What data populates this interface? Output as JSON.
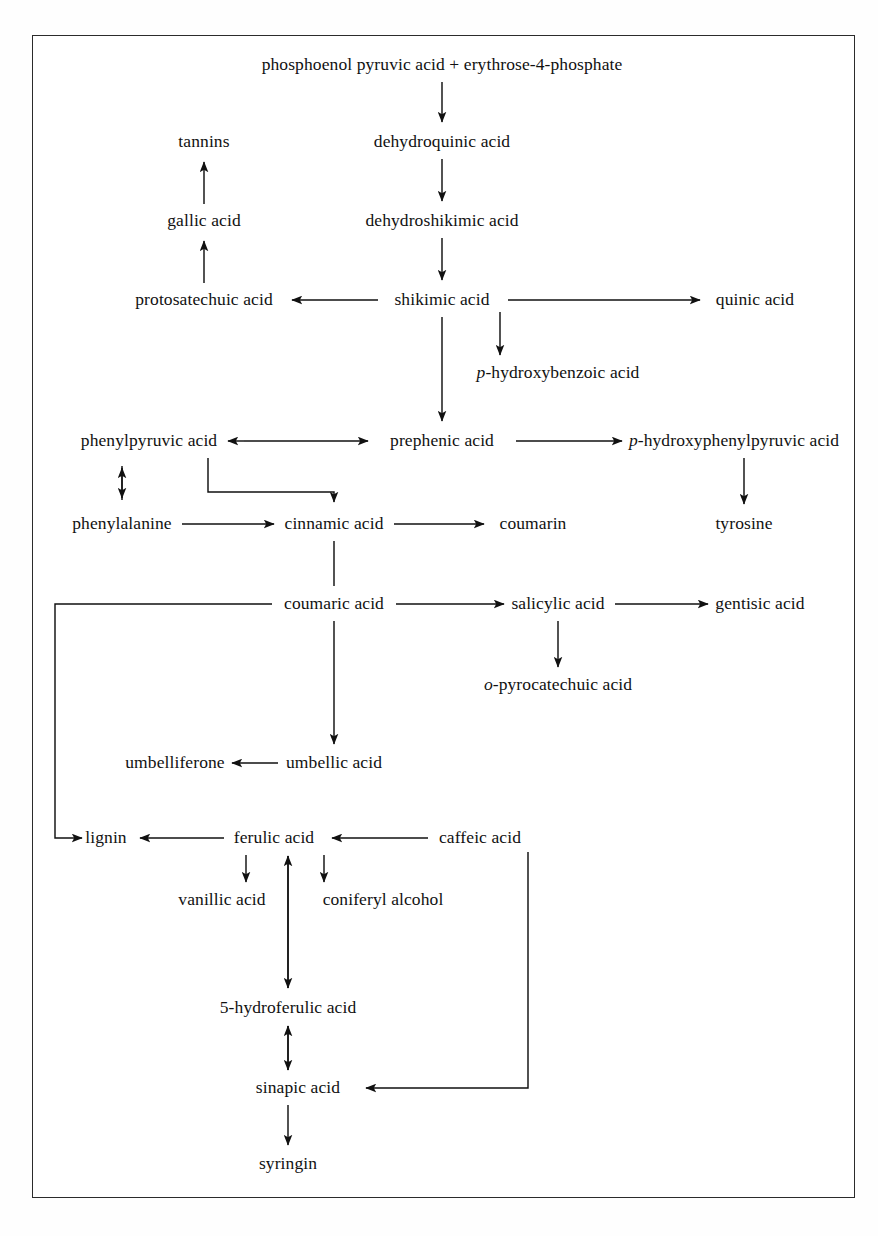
{
  "figure": {
    "frame_color": "#2b2b2b",
    "background_color": "#ffffff",
    "text_color": "#111111",
    "caption": ""
  },
  "nodes": [
    {
      "id": "pep",
      "label_prefix": "",
      "label": "phosphoenol pyruvic acid + erythrose-4-phosphate",
      "x": 442,
      "y": 65
    },
    {
      "id": "dehydroquinic",
      "label_prefix": "",
      "label": "dehydroquinic acid",
      "x": 442,
      "y": 142
    },
    {
      "id": "dehydroshikimic",
      "label_prefix": "",
      "label": "dehydroshikimic acid",
      "x": 442,
      "y": 221
    },
    {
      "id": "shikimic",
      "label_prefix": "",
      "label": "shikimic acid",
      "x": 442,
      "y": 300
    },
    {
      "id": "tannins",
      "label_prefix": "",
      "label": "tannins",
      "x": 204,
      "y": 142
    },
    {
      "id": "gallic",
      "label_prefix": "",
      "label": "gallic acid",
      "x": 204,
      "y": 221
    },
    {
      "id": "protosatechuic",
      "label_prefix": "",
      "label": "protosatechuic acid",
      "x": 204,
      "y": 300
    },
    {
      "id": "quinic",
      "label_prefix": "",
      "label": "quinic acid",
      "x": 755,
      "y": 300
    },
    {
      "id": "phba",
      "label_prefix": "p",
      "label": "-hydroxybenzoic acid",
      "x": 558,
      "y": 373
    },
    {
      "id": "phenylpyruvic",
      "label_prefix": "",
      "label": "phenylpyruvic acid",
      "x": 149,
      "y": 441
    },
    {
      "id": "prephenic",
      "label_prefix": "",
      "label": "prephenic acid",
      "x": 442,
      "y": 441
    },
    {
      "id": "hppa",
      "label_prefix": "p",
      "label": "-hydroxyphenylpyruvic acid",
      "x": 734,
      "y": 441
    },
    {
      "id": "phenylalanine",
      "label_prefix": "",
      "label": "phenylalanine",
      "x": 122,
      "y": 524
    },
    {
      "id": "cinnamic",
      "label_prefix": "",
      "label": "cinnamic acid",
      "x": 334,
      "y": 524
    },
    {
      "id": "coumarin",
      "label_prefix": "",
      "label": "coumarin",
      "x": 533,
      "y": 524
    },
    {
      "id": "tyrosine",
      "label_prefix": "",
      "label": "tyrosine",
      "x": 744,
      "y": 524
    },
    {
      "id": "coumaric",
      "label_prefix": "",
      "label": "coumaric acid",
      "x": 334,
      "y": 604
    },
    {
      "id": "salicylic",
      "label_prefix": "",
      "label": "salicylic acid",
      "x": 558,
      "y": 604
    },
    {
      "id": "gentisic",
      "label_prefix": "",
      "label": "gentisic acid",
      "x": 760,
      "y": 604
    },
    {
      "id": "pyrocatechuic",
      "label_prefix": "o",
      "label": "-pyrocatechuic acid",
      "x": 558,
      "y": 685
    },
    {
      "id": "umbelliferone",
      "label_prefix": "",
      "label": "umbelliferone",
      "x": 175,
      "y": 763
    },
    {
      "id": "umbellic",
      "label_prefix": "",
      "label": "umbellic acid",
      "x": 334,
      "y": 763
    },
    {
      "id": "lignin",
      "label_prefix": "",
      "label": "lignin",
      "x": 106,
      "y": 838
    },
    {
      "id": "ferulic",
      "label_prefix": "",
      "label": "ferulic acid",
      "x": 274,
      "y": 838
    },
    {
      "id": "caffeic",
      "label_prefix": "",
      "label": "caffeic acid",
      "x": 480,
      "y": 838
    },
    {
      "id": "vanillic",
      "label_prefix": "",
      "label": "vanillic acid",
      "x": 222,
      "y": 900
    },
    {
      "id": "coniferyl",
      "label_prefix": "",
      "label": "coniferyl alcohol",
      "x": 383,
      "y": 900
    },
    {
      "id": "hydroferulic",
      "label_prefix": "",
      "label": "5-hydroferulic acid",
      "x": 288,
      "y": 1008
    },
    {
      "id": "sinapic",
      "label_prefix": "",
      "label": "sinapic acid",
      "x": 298,
      "y": 1088
    },
    {
      "id": "syringin",
      "label_prefix": "",
      "label": "syringin",
      "x": 288,
      "y": 1164
    }
  ],
  "edges": [
    {
      "from": "pep",
      "to": "dehydroquinic",
      "type": "arrow-down"
    },
    {
      "from": "dehydroquinic",
      "to": "dehydroshikimic",
      "type": "arrow-down"
    },
    {
      "from": "dehydroshikimic",
      "to": "shikimic",
      "type": "arrow-down"
    },
    {
      "from": "shikimic",
      "to": "protosatechuic",
      "type": "arrow-left"
    },
    {
      "from": "shikimic",
      "to": "quinic",
      "type": "arrow-right"
    },
    {
      "from": "shikimic",
      "to": "phba",
      "type": "arrow-down"
    },
    {
      "from": "shikimic",
      "to": "prephenic",
      "type": "arrow-down"
    },
    {
      "from": "protosatechuic",
      "to": "gallic",
      "type": "arrow-up"
    },
    {
      "from": "gallic",
      "to": "tannins",
      "type": "arrow-up"
    },
    {
      "from": "phenylpyruvic",
      "to": "prephenic",
      "type": "arrow-both-horizontal"
    },
    {
      "from": "prephenic",
      "to": "hppa",
      "type": "arrow-right"
    },
    {
      "from": "hppa",
      "to": "tyrosine",
      "type": "arrow-down"
    },
    {
      "from": "phenylalanine",
      "to": "phenylpyruvic",
      "type": "arrow-both-vertical"
    },
    {
      "from": "phenylalanine",
      "to": "cinnamic",
      "type": "arrow-right"
    },
    {
      "from": "phenylpyruvic",
      "to": "cinnamic",
      "type": "elbow-down-right"
    },
    {
      "from": "cinnamic",
      "to": "coumarin",
      "type": "arrow-right"
    },
    {
      "from": "cinnamic",
      "to": "coumaric",
      "type": "line-down"
    },
    {
      "from": "coumaric",
      "to": "salicylic",
      "type": "arrow-right"
    },
    {
      "from": "salicylic",
      "to": "gentisic",
      "type": "arrow-right"
    },
    {
      "from": "salicylic",
      "to": "pyrocatechuic",
      "type": "arrow-down"
    },
    {
      "from": "coumaric",
      "to": "umbellic",
      "type": "arrow-down"
    },
    {
      "from": "umbellic",
      "to": "umbelliferone",
      "type": "arrow-left"
    },
    {
      "from": "coumaric",
      "to": "lignin",
      "type": "elbow-left-down"
    },
    {
      "from": "ferulic",
      "to": "lignin",
      "type": "arrow-left"
    },
    {
      "from": "caffeic",
      "to": "ferulic",
      "type": "arrow-left"
    },
    {
      "from": "ferulic",
      "to": "vanillic",
      "type": "arrow-down"
    },
    {
      "from": "ferulic",
      "to": "coniferyl",
      "type": "arrow-down"
    },
    {
      "from": "ferulic",
      "to": "hydroferulic",
      "type": "arrow-both-vertical"
    },
    {
      "from": "hydroferulic",
      "to": "sinapic",
      "type": "arrow-both-vertical"
    },
    {
      "from": "caffeic",
      "to": "sinapic",
      "type": "elbow-down-left"
    },
    {
      "from": "sinapic",
      "to": "syringin",
      "type": "arrow-down"
    }
  ]
}
